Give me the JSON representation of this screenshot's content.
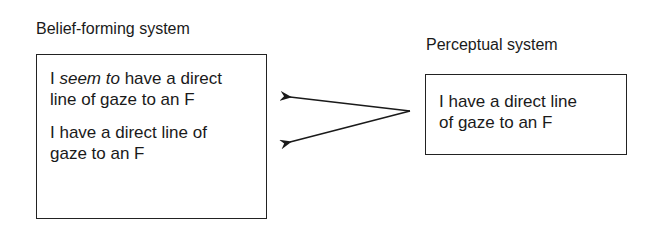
{
  "belief_system": {
    "title": "Belief-forming system",
    "statement1": {
      "prefix": "I ",
      "emphasis": "seem to",
      "line1_rest": " have a direct",
      "line2": "line of gaze to an F"
    },
    "statement2": {
      "line1": "I have a direct line of",
      "line2": "gaze to an F"
    }
  },
  "perceptual_system": {
    "title": "Perceptual system",
    "statement": {
      "line1": "I have a direct line",
      "line2": "of gaze to an F"
    }
  },
  "arrows": {
    "origin": [
      410,
      111
    ],
    "targets": [
      [
        288,
        97
      ],
      [
        288,
        142
      ]
    ],
    "color": "#1a1a1a"
  }
}
